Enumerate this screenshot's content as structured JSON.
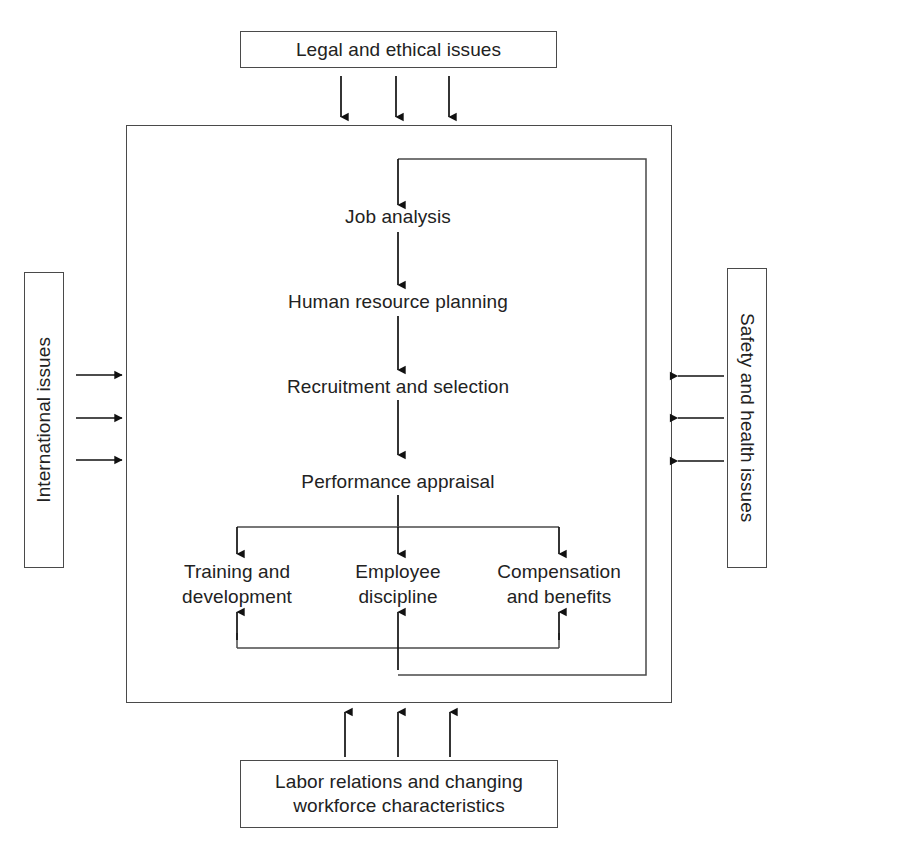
{
  "diagram": {
    "type": "flowchart",
    "external_factors": {
      "top": "Legal and ethical issues",
      "left": "International issues",
      "right": "Safety and health issues",
      "bottom": "Labor relations and changing workforce characteristics"
    },
    "process_steps": [
      {
        "id": "job-analysis",
        "label": "Job analysis"
      },
      {
        "id": "human-resource-planning",
        "label": "Human resource planning"
      },
      {
        "id": "recruitment-and-selection",
        "label": "Recruitment and selection"
      },
      {
        "id": "performance-appraisal",
        "label": "Performance appraisal"
      }
    ],
    "branch_steps": [
      {
        "id": "training-and-development",
        "line1": "Training and",
        "line2": "development"
      },
      {
        "id": "employee-discipline",
        "line1": "Employee",
        "line2": "discipline"
      },
      {
        "id": "compensation-and-benefits",
        "line1": "Compensation",
        "line2": "and benefits"
      }
    ],
    "colors": {
      "stroke": "#4a4a4a",
      "arrow": "#111111",
      "text": "#222222",
      "background": "#ffffff"
    }
  }
}
